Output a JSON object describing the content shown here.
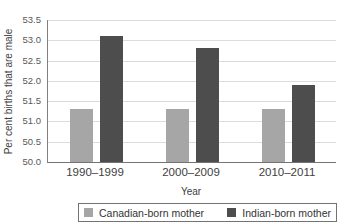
{
  "chart_data": {
    "type": "bar",
    "title": "time for mothers born in Canada to mothers born in India, 1990–2011",
    "title_note": "title line is cut off at the top edge of the screenshot",
    "categories": [
      "1990–1999",
      "2000–2009",
      "2010–2011"
    ],
    "series": [
      {
        "name": "Canadian-born mother",
        "color": "#a6a6a6",
        "values": [
          51.3,
          51.3,
          51.3
        ]
      },
      {
        "name": "Indian-born mother",
        "color": "#4d4d4d",
        "values": [
          53.1,
          52.8,
          51.9
        ]
      }
    ],
    "xlabel": "Year",
    "ylabel": "Per cent births that are male",
    "ylim": [
      50.0,
      53.5
    ],
    "ytick_step": 0.5,
    "yticks": [
      "53.5",
      "53.0",
      "52.5",
      "52.0",
      "51.5",
      "51.0",
      "50.5",
      "50.0"
    ],
    "grid": true,
    "legend_position": "bottom"
  },
  "colors": {
    "background": "#ffffff",
    "gridline": "#dcdcdc",
    "axis": "#808080",
    "tick_text": "#595959",
    "label_text": "#404040",
    "legend_border": "#737373"
  }
}
